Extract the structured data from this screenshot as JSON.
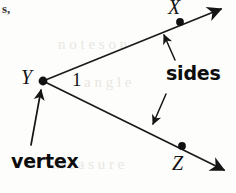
{
  "figure": {
    "type": "geometry-diagram",
    "corner_fragment": "s,",
    "point_labels": {
      "x": "X",
      "y": "Y",
      "z": "Z"
    },
    "angle_number": "1",
    "callouts": {
      "sides": "sides",
      "vertex": "vertex"
    },
    "colors": {
      "ink": "#141414",
      "line": "#1a1a1a",
      "paper": "#fdfdfb",
      "ghost": "#e9e7e2"
    },
    "background_ghost_text": {
      "line1": "n o t e s   o n",
      "line2": "a n g l e",
      "line3": "m e a s u r e"
    },
    "geometry": {
      "vertex_point": {
        "x": 43,
        "y": 81
      },
      "point_x": {
        "x": 180,
        "y": 22
      },
      "point_z": {
        "x": 182,
        "y": 146
      },
      "upper_ray_tip": {
        "x": 224,
        "y": 6
      },
      "lower_ray_tip": {
        "x": 228,
        "y": 174
      }
    }
  }
}
